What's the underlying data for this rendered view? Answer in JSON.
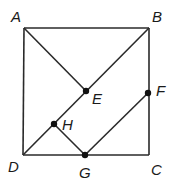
{
  "diagram": {
    "type": "geometry",
    "shape": "square ABCD with inner segments",
    "stroke_color": "#2a2a2a",
    "points": {
      "A": {
        "label": "A",
        "x": 24,
        "y": 28
      },
      "B": {
        "label": "B",
        "x": 149,
        "y": 28
      },
      "C": {
        "label": "C",
        "x": 149,
        "y": 155
      },
      "D": {
        "label": "D",
        "x": 23,
        "y": 155
      },
      "E": {
        "label": "E",
        "x": 86,
        "y": 91
      },
      "F": {
        "label": "F",
        "x": 148,
        "y": 93
      },
      "G": {
        "label": "G",
        "x": 85,
        "y": 155
      },
      "H": {
        "label": "H",
        "x": 54,
        "y": 124
      }
    },
    "segments": [
      "AB",
      "BC",
      "CD",
      "DA",
      "AE",
      "DB",
      "HG",
      "GF"
    ],
    "marked_points": [
      "E",
      "F",
      "G",
      "H"
    ]
  }
}
